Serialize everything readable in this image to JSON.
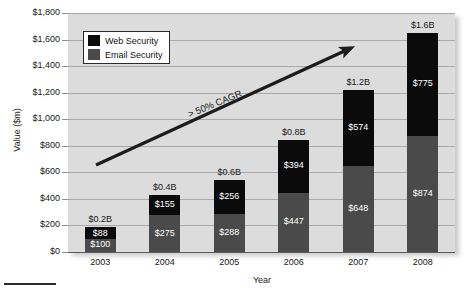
{
  "chart_data": {
    "type": "bar",
    "subtype": "stacked-bar",
    "title": "",
    "xlabel": "Year",
    "ylabel": "Value ($m)",
    "categories": [
      "2003",
      "2004",
      "2005",
      "2006",
      "2007",
      "2008"
    ],
    "series": [
      {
        "name": "Web Security",
        "color": "#0b0b0b",
        "values": [
          88,
          155,
          256,
          394,
          574,
          775
        ],
        "value_labels": [
          "$88",
          "$155",
          "$256",
          "$394",
          "$574",
          "$775"
        ]
      },
      {
        "name": "Email Security",
        "color": "#4a4a4a",
        "values": [
          100,
          275,
          288,
          447,
          648,
          874
        ],
        "value_labels": [
          "$100",
          "$275",
          "$288",
          "$447",
          "$648",
          "$874"
        ]
      }
    ],
    "totals": [
      188,
      430,
      544,
      841,
      1222,
      1649
    ],
    "total_labels": [
      "$0.2B",
      "$0.4B",
      "$0.6B",
      "$0.8B",
      "$1.2B",
      "$1.6B"
    ],
    "ylim": [
      0,
      1800
    ],
    "ytick_step": 200,
    "ytick_labels": [
      "$0",
      "$200",
      "$400",
      "$600",
      "$800",
      "$1,000",
      "$1,200",
      "$1,400",
      "$1,600",
      "$1,800"
    ],
    "grid": true,
    "legend_position": "top-left",
    "annotations": [
      {
        "text": "> 50% CAGR",
        "kind": "trend-arrow"
      }
    ]
  },
  "legend": {
    "items": [
      {
        "label": "Web Security",
        "color": "#0b0b0b"
      },
      {
        "label": "Email Security",
        "color": "#4a4a4a"
      }
    ]
  },
  "axes": {
    "y_title": "Value ($m)",
    "x_title": "Year"
  },
  "annotation": {
    "cagr": "> 50% CAGR"
  },
  "colors": {
    "plot_background": "#dcdcdc",
    "gridline": "#a9a9a9",
    "web_security": "#0b0b0b",
    "email_security": "#4a4a4a",
    "text": "#1a1a1a"
  }
}
